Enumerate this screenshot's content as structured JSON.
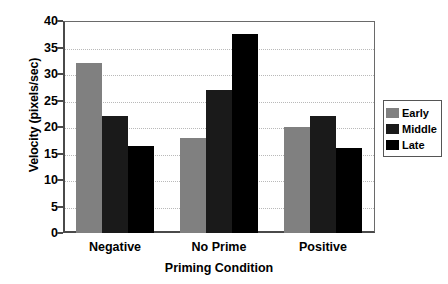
{
  "chart_data": {
    "type": "bar",
    "title": "",
    "xlabel": "Priming Condition",
    "ylabel": "Velocity (pixels/sec)",
    "categories": [
      "Negative",
      "No Prime",
      "Positive"
    ],
    "series": [
      {
        "name": "Early",
        "color": "#808080",
        "values": [
          32,
          18,
          20
        ]
      },
      {
        "name": "Middle",
        "color": "#1a1a1a",
        "values": [
          22,
          27,
          22
        ]
      },
      {
        "name": "Late",
        "color": "#000000",
        "values": [
          16.5,
          37.5,
          16
        ]
      }
    ],
    "ylim": [
      0,
      40
    ],
    "yticks": [
      0,
      5,
      10,
      15,
      20,
      25,
      30,
      35,
      40
    ],
    "ytick_labels": [
      "0",
      "5",
      "10",
      "15",
      "20",
      "25",
      "30",
      "35",
      "40"
    ],
    "grid": true,
    "grid_style": "dotted-horizontal",
    "legend_position": "right"
  }
}
